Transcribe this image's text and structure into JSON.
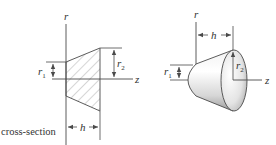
{
  "figure": {
    "cross_section": {
      "axis_r_label": "r",
      "axis_z_label": "z",
      "r1_label": "r",
      "r1_sub": "1",
      "r2_label": "r",
      "r2_sub": "2",
      "h_label": "h",
      "caption": "cross-section"
    },
    "solid": {
      "axis_r_label": "r",
      "axis_z_label": "z",
      "r1_label": "r",
      "r1_sub": "1",
      "r2_label": "r",
      "r2_sub": "2",
      "h_label": "h"
    },
    "colors": {
      "line": "#4a4a4a",
      "hatch": "#8a8a8a",
      "text": "#333333",
      "solid_light": "#f4f4f4",
      "solid_dark": "#9a9a9a"
    }
  }
}
